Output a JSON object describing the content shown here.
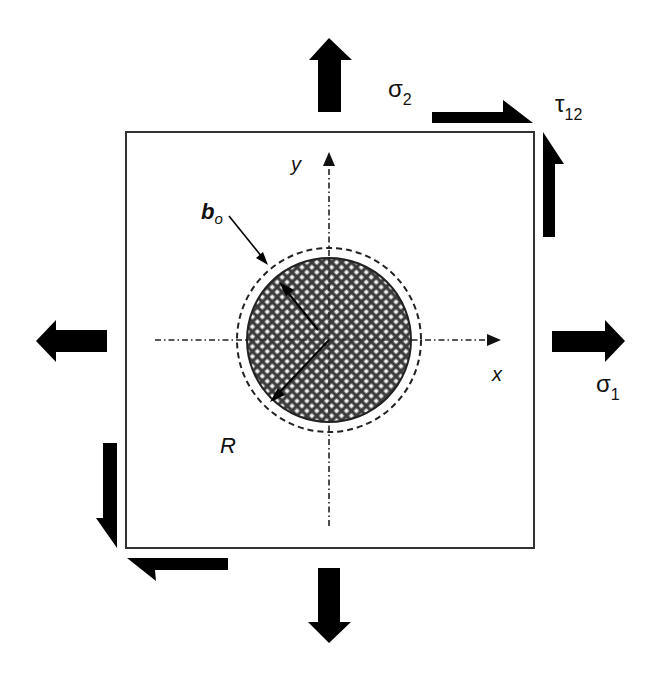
{
  "figure": {
    "colors": {
      "ink": "#000000",
      "plate_border": "#333333",
      "hatch_fill": "#3a3a3a",
      "hatch_light": "#f2f2f2",
      "background": "#ffffff"
    }
  },
  "labels": {
    "sigma2": "σ",
    "sigma2_sub": "2",
    "sigma1": "σ",
    "sigma1_sub": "1",
    "tau": "τ",
    "tau_sub": "12",
    "y_axis": "y",
    "x_axis": "x",
    "interphase": "b",
    "interphase_sub": "o",
    "radius": "R"
  },
  "elements": {
    "plate": "square plate",
    "inclusion": "cross-hatched circular inclusion",
    "interphase_boundary": "dashed circle",
    "normal_arrows": [
      "top-sigma2",
      "bottom-sigma2",
      "left-sigma1",
      "right-sigma1"
    ],
    "shear_arrows": [
      "top-tau12",
      "right-tau12",
      "left-tau12",
      "bottom-tau12"
    ]
  }
}
